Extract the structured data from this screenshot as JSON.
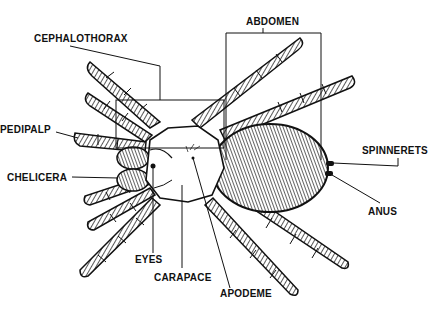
{
  "diagram": {
    "labels": {
      "cephalothorax": "CEPHALOTHORAX",
      "abdomen": "ABDOMEN",
      "pedipalp": "PEDIPALP",
      "chelicera": "CHELICERA",
      "spinnerets": "SPINNERETS",
      "anus": "ANUS",
      "eyes": "EYES",
      "carapace": "CARAPACE",
      "apodeme": "APODEME"
    },
    "colors": {
      "ink": "#111111",
      "background": "#ffffff"
    }
  }
}
